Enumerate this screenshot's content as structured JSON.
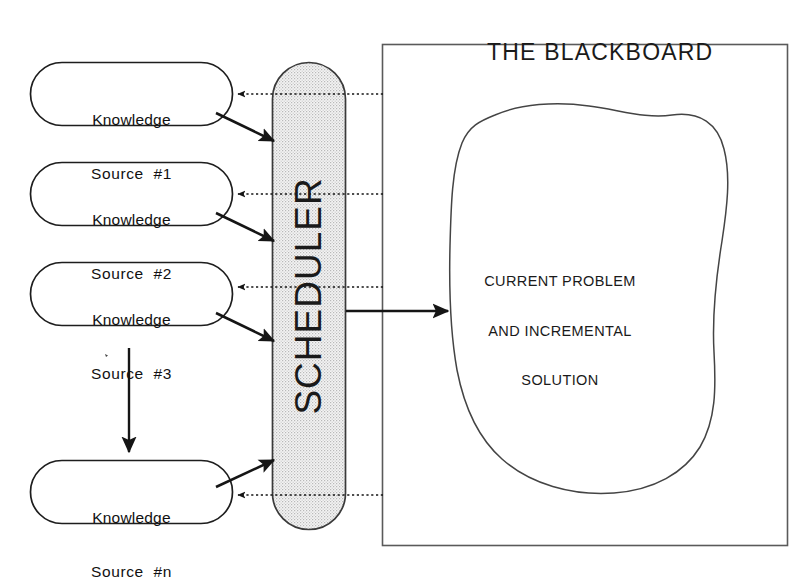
{
  "diagram": {
    "type": "blackboard-architecture",
    "blackboard": {
      "title": "THE BLACKBOARD",
      "blob_text_lines": [
        "CURRENT PROBLEM",
        "AND INCREMENTAL",
        "SOLUTION"
      ],
      "blob_text": "CURRENT PROBLEM AND INCREMENTAL SOLUTION",
      "border_color": "#555555",
      "fill_color": "#ffffff"
    },
    "scheduler": {
      "label": "SCHEDULER",
      "orientation": "vertical-rotated",
      "fill_color": "#e6e6e6",
      "border_color": "#3a3a3a"
    },
    "knowledge_sources": [
      {
        "line1": "Knowledge",
        "line2": "Source  #1"
      },
      {
        "line1": "Knowledge",
        "line2": "Source  #2"
      },
      {
        "line1": "Knowledge",
        "line2": "Source  #3"
      },
      {
        "line1": "Knowledge",
        "line2": "Source  #n"
      }
    ],
    "connectors": {
      "solid_label": "activation / invocation (solid arrow)",
      "dotted_label": "notification / trigger (dotted arrow)",
      "scheduler_to_blackboard_label": "scheduler writes to blackboard",
      "continuation_label": "more knowledge sources (vertical arrow)"
    },
    "colors": {
      "ink": "#111111",
      "line": "#222222",
      "stipple": "#e2e2e2"
    }
  }
}
